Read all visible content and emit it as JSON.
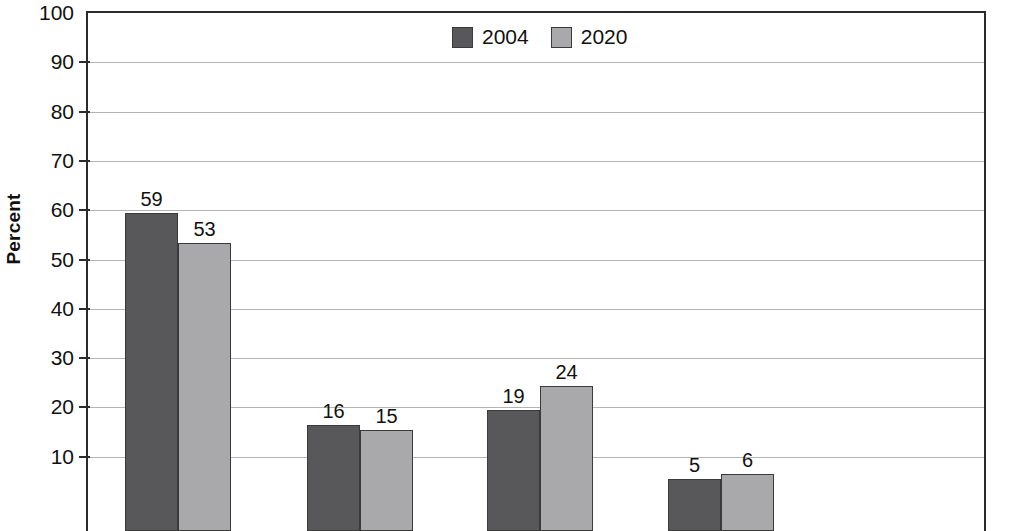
{
  "chart_data": {
    "type": "bar",
    "title": "",
    "subtitle": "",
    "xlabel": "",
    "ylabel": "Percent",
    "ylim": [
      0,
      100
    ],
    "ytick_step": 10,
    "yticks": [
      10,
      20,
      30,
      40,
      50,
      60,
      70,
      80,
      90,
      100
    ],
    "ytick_labels": [
      "10",
      "20",
      "30",
      "40",
      "50",
      "60",
      "70",
      "80",
      "90",
      "100"
    ],
    "grid": true,
    "legend_position": "top-center",
    "categories": [
      "",
      "",
      "",
      ""
    ],
    "series": [
      {
        "name": "2004",
        "color": "#58585a",
        "values": [
          59,
          16,
          19,
          5
        ],
        "value_labels": [
          "59",
          "16",
          "19",
          "5"
        ]
      },
      {
        "name": "2020",
        "color": "#a9a9ab",
        "values": [
          53,
          15,
          24,
          6
        ],
        "value_labels": [
          "53",
          "15",
          "24",
          "6"
        ]
      }
    ]
  },
  "legend": {
    "entries": [
      {
        "label": "2004",
        "color": "#58585a",
        "swatch": "legend-swatch-2004"
      },
      {
        "label": "2020",
        "color": "#a9a9ab",
        "swatch": "legend-swatch-2020"
      }
    ]
  },
  "axis": {
    "y_title": "Percent"
  },
  "colors": {
    "series_2004": "#58585a",
    "series_2020": "#a9a9ab",
    "gridline": "#b4b4b4",
    "axis": "#2b2b2b",
    "background": "#ffffff",
    "text": "#111111"
  }
}
